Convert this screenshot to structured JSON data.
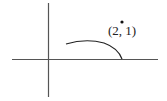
{
  "figure": {
    "type": "coordinate-sketch",
    "axes": {
      "x_axis": {
        "x1": 12,
        "y1": 59.5,
        "x2": 158,
        "y2": 59.5
      },
      "y_axis": {
        "x1": 48.5,
        "y1": 3,
        "x2": 48.5,
        "y2": 97
      },
      "stroke": "#555555"
    },
    "curve": {
      "description": "arc from upper-left descending to the x-axis",
      "path": "M 66 44 Q 86 38 104 43 Q 118 48 122 59",
      "stroke": "#222222"
    },
    "point": {
      "x": 122,
      "y": 22,
      "r": 1.6,
      "color": "#111111"
    },
    "point_label": {
      "text": "(2, 1)",
      "x": 108,
      "y": 35
    }
  }
}
